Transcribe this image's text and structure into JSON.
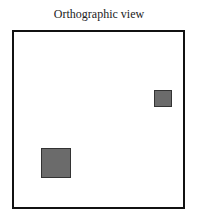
{
  "title": "Orthographic view",
  "view": {
    "frame": {
      "x": 12,
      "y": 30,
      "width": 173,
      "height": 179,
      "border_color": "#111111"
    },
    "objects": [
      {
        "name": "small-square",
        "x": 154,
        "y": 90,
        "width": 18,
        "height": 17,
        "fill": "#6b6b6b"
      },
      {
        "name": "large-square",
        "x": 41,
        "y": 148,
        "width": 30,
        "height": 30,
        "fill": "#6b6b6b"
      }
    ]
  }
}
